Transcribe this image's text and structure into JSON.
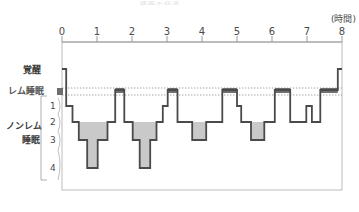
{
  "title_faint": "睡眠の経過",
  "axis": {
    "unit_label": "(時間)",
    "x_ticks": [
      0,
      1,
      2,
      3,
      4,
      5,
      6,
      7,
      8
    ],
    "x_min": 0,
    "x_max": 8
  },
  "y_labels": {
    "awake": "覚醒",
    "rem": "レム睡眠",
    "nonrem_line1": "ノンレム",
    "nonrem_line2": "睡眠",
    "stages": [
      "1",
      "2",
      "3",
      "4"
    ]
  },
  "colors": {
    "line": "#4a4a4a",
    "fill_deep": "#c9c9c9",
    "frame": "#bdbdbd",
    "dotted": "#8a8a8a",
    "rem_band": "#6e6e6e",
    "text": "#3a3a3a"
  },
  "chart_data": {
    "type": "line",
    "title": "睡眠の経過",
    "xlabel": "(時間)",
    "ylabel": "睡眠段階",
    "xlim": [
      0,
      8
    ],
    "grid": false,
    "legend": "none",
    "y_categories": [
      "覚醒",
      "レム睡眠",
      "1",
      "2",
      "3",
      "4"
    ],
    "y_category_note": "上から 覚醒(awake) → レム睡眠(REM) → ノンレム睡眠 段階1〜4 (深くなる)",
    "annotations": [
      "レム睡眠の上下に破線（レム睡眠帯）",
      "段階3〜4のノンレム睡眠（深睡眠）は灰色で塗りつぶし"
    ],
    "series": [
      {
        "name": "睡眠段階",
        "steps": [
          {
            "t_start": 0.0,
            "t_end": 0.12,
            "stage": "覚醒"
          },
          {
            "t_start": 0.12,
            "t_end": 0.3,
            "stage": "1"
          },
          {
            "t_start": 0.3,
            "t_end": 0.48,
            "stage": "2"
          },
          {
            "t_start": 0.48,
            "t_end": 0.72,
            "stage": "3"
          },
          {
            "t_start": 0.72,
            "t_end": 1.02,
            "stage": "4"
          },
          {
            "t_start": 1.02,
            "t_end": 1.3,
            "stage": "3"
          },
          {
            "t_start": 1.3,
            "t_end": 1.52,
            "stage": "2"
          },
          {
            "t_start": 1.52,
            "t_end": 1.78,
            "stage": "レム睡眠"
          },
          {
            "t_start": 1.78,
            "t_end": 2.02,
            "stage": "2"
          },
          {
            "t_start": 2.02,
            "t_end": 2.22,
            "stage": "3"
          },
          {
            "t_start": 2.22,
            "t_end": 2.52,
            "stage": "4"
          },
          {
            "t_start": 2.52,
            "t_end": 2.7,
            "stage": "3"
          },
          {
            "t_start": 2.7,
            "t_end": 2.88,
            "stage": "2"
          },
          {
            "t_start": 2.88,
            "t_end": 3.02,
            "stage": "1"
          },
          {
            "t_start": 3.02,
            "t_end": 3.3,
            "stage": "レム睡眠"
          },
          {
            "t_start": 3.3,
            "t_end": 3.72,
            "stage": "2"
          },
          {
            "t_start": 3.72,
            "t_end": 4.12,
            "stage": "3"
          },
          {
            "t_start": 4.12,
            "t_end": 4.58,
            "stage": "2"
          },
          {
            "t_start": 4.58,
            "t_end": 5.0,
            "stage": "レム睡眠"
          },
          {
            "t_start": 5.0,
            "t_end": 5.12,
            "stage": "1"
          },
          {
            "t_start": 5.12,
            "t_end": 5.4,
            "stage": "2"
          },
          {
            "t_start": 5.4,
            "t_end": 5.78,
            "stage": "3"
          },
          {
            "t_start": 5.78,
            "t_end": 6.08,
            "stage": "2"
          },
          {
            "t_start": 6.08,
            "t_end": 6.52,
            "stage": "レム睡眠"
          },
          {
            "t_start": 6.52,
            "t_end": 6.98,
            "stage": "2"
          },
          {
            "t_start": 6.98,
            "t_end": 7.14,
            "stage": "1"
          },
          {
            "t_start": 7.14,
            "t_end": 7.38,
            "stage": "2"
          },
          {
            "t_start": 7.38,
            "t_end": 7.88,
            "stage": "レム睡眠"
          },
          {
            "t_start": 7.88,
            "t_end": 8.0,
            "stage": "覚醒"
          }
        ]
      }
    ]
  }
}
